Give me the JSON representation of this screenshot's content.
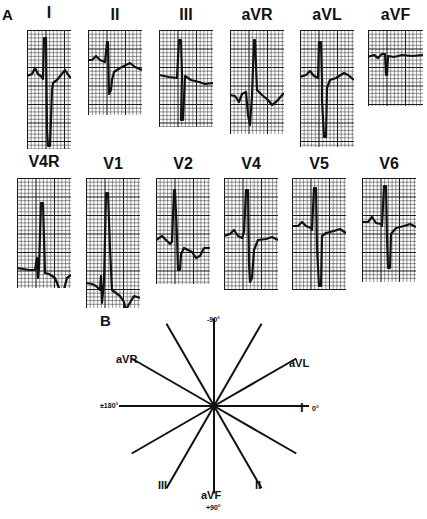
{
  "figure": {
    "panel_a_label": "A",
    "panel_b_label": "B"
  },
  "ecg": {
    "grid_colors": {
      "major": "#1a1a1a",
      "minor": "#3a3a3a",
      "trace": "#111111",
      "paper": "#ffffff"
    },
    "leads": [
      {
        "label": "I",
        "x": 27,
        "y": 30,
        "w": 44,
        "h": 119,
        "trace": "M0,46 L5,44 L8,38 L11,44 L15,47 L16,49 L17,8 L19,8 L20,100 L21,116 L23,116 L25,60 L26,53 L30,50 L34,45 L38,40 L42,46 L44,48"
      },
      {
        "label": "II",
        "x": 88,
        "y": 30,
        "w": 54,
        "h": 85,
        "trace": "M0,30 L4,30 L8,26 L12,30 L17,32 L19,12 L20,12 L21,64 L23,60 L24,50 L26,42 L32,38 L38,35 L42,33 L47,37 L54,40"
      },
      {
        "label": "III",
        "x": 159,
        "y": 30,
        "w": 54,
        "h": 97,
        "trace": "M0,45 L10,47 L18,48 L20,10 L22,10 L23,45 L22,90 L24,90 L26,46 L32,50 L40,52 L46,54 L54,53"
      },
      {
        "label": "aVR",
        "x": 230,
        "y": 30,
        "w": 54,
        "h": 104,
        "trace": "M0,65 L5,66 L9,72 L12,64 L16,62 L18,85 L20,95 L22,66 L24,10 L25,10 L27,60 L32,65 L38,70 L42,75 L46,72 L54,63"
      },
      {
        "label": "aVL",
        "x": 300,
        "y": 30,
        "w": 54,
        "h": 117,
        "trace": "M0,47 L6,45 L10,41 L14,46 L18,48 L19,12 L21,12 L22,50 L22,70 L24,107 L26,107 L27,58 L30,50 L36,48 L44,43 L48,45 L54,50"
      },
      {
        "label": "aVF",
        "x": 368,
        "y": 30,
        "w": 55,
        "h": 76,
        "trace": "M0,27 L6,25 L10,28 L14,24 L17,24 L18,45 L19,45 L20,26 L26,27 L34,25 L44,26 L55,25"
      }
    ],
    "leads_row2": [
      {
        "label": "V4R",
        "x": 17,
        "y": 178,
        "w": 54,
        "h": 110,
        "trace": "M0,90 L12,92 L18,92 L20,80 L21,100 L22,90 L24,25 L26,25 L28,95 L32,96 L38,100 L42,110 L46,115 L50,100 L54,97"
      },
      {
        "label": "V1",
        "x": 86,
        "y": 178,
        "w": 54,
        "h": 130,
        "trace": "M0,105 L6,106 L10,108 L14,112 L15,98 L16,125 L18,104 L19,60 L20,15 L22,15 L24,70 L26,112 L30,115 L34,118 L38,124 L40,133 L42,128 L48,118 L54,120"
      },
      {
        "label": "V2",
        "x": 156,
        "y": 178,
        "w": 54,
        "h": 106,
        "trace": "M0,62 L6,58 L10,62 L14,66 L16,64 L18,12 L19,12 L21,58 L22,92 L24,92 L25,76 L28,70 L32,72 L36,74 L40,80 L44,78 L48,70 L54,70"
      },
      {
        "label": "V4",
        "x": 224,
        "y": 178,
        "w": 54,
        "h": 112,
        "trace": "M0,58 L6,56 L10,52 L14,58 L18,60 L20,54 L22,12 L24,12 L25,86 L26,104 L28,100 L30,72 L34,62 L42,61 L48,59 L54,62"
      },
      {
        "label": "V5",
        "x": 292,
        "y": 178,
        "w": 54,
        "h": 112,
        "trace": "M0,48 L6,48 L10,44 L14,48 L19,50 L20,52 L22,10 L24,10 L25,70 L27,108 L29,108 L30,58 L34,55 L42,53 L48,51 L54,55"
      },
      {
        "label": "V6",
        "x": 362,
        "y": 178,
        "w": 54,
        "h": 104,
        "trace": "M0,44 L6,44 L10,39 L14,45 L19,46 L20,48 L22,8 L24,8 L25,60 L26,90 L28,90 L29,56 L34,50 L42,48 L48,46 L54,49"
      }
    ],
    "label_positions_row1": [
      {
        "x": 14,
        "y": 4
      },
      {
        "x": 80,
        "y": 6
      },
      {
        "x": 150,
        "y": 6
      },
      {
        "x": 223,
        "y": 6
      },
      {
        "x": 290,
        "y": 6
      },
      {
        "x": 360,
        "y": 6
      }
    ],
    "label_positions_row2": [
      {
        "x": 7,
        "y": 153
      },
      {
        "x": 74,
        "y": 155
      },
      {
        "x": 145,
        "y": 155
      },
      {
        "x": 213,
        "y": 155
      },
      {
        "x": 280,
        "y": 155
      },
      {
        "x": 352,
        "y": 155
      }
    ]
  },
  "hexaxial": {
    "center": {
      "x": 214,
      "y": 406
    },
    "line_color": "#111111",
    "axes_deg": [
      0,
      30,
      60,
      90,
      120,
      150,
      180,
      210,
      240,
      270,
      300,
      330
    ],
    "radius": 95,
    "labels": {
      "minus90": "-90°",
      "aVR": "aVR",
      "aVL": "aVL",
      "plusminus180": "±180°",
      "I": "I",
      "zero": "0°",
      "III": "III",
      "aVF": "aVF",
      "II": "II",
      "plus90": "+90°"
    }
  }
}
